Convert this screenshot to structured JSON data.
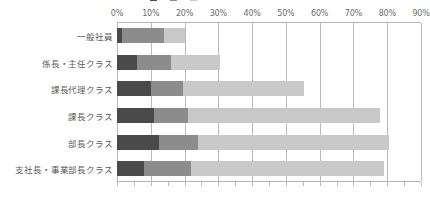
{
  "chart_data": {
    "type": "bar",
    "orientation": "horizontal",
    "stacked": true,
    "title": "",
    "xlabel": "",
    "ylabel": "",
    "xlim": [
      0,
      90
    ],
    "grid": true,
    "legend_position": "top",
    "legend_clipped": true,
    "categories": [
      "一般社員",
      "係長・主任クラス",
      "課長代理クラス",
      "課長クラス",
      "部長クラス",
      "支社長・事業部長クラス"
    ],
    "tick_labels": [
      "0%",
      "10%",
      "20%",
      "30%",
      "40%",
      "50%",
      "60%",
      "70%",
      "80%",
      "90%"
    ],
    "tick_values": [
      0,
      10,
      20,
      30,
      40,
      50,
      60,
      70,
      80,
      90
    ],
    "series": [
      {
        "name": "series-1",
        "color": "#4a4a4a",
        "values": [
          1.5,
          6.0,
          10.0,
          11.0,
          12.5,
          8.0
        ]
      },
      {
        "name": "series-2",
        "color": "#8c8c8c",
        "values": [
          12.5,
          10.0,
          9.5,
          10.0,
          11.5,
          14.0
        ]
      },
      {
        "name": "series-3",
        "color": "#c9c9c9",
        "values": [
          6.0,
          14.5,
          36.0,
          57.0,
          56.5,
          57.0
        ]
      }
    ],
    "totals": [
      20.0,
      30.5,
      55.5,
      78.0,
      80.5,
      79.0
    ]
  },
  "legend": {
    "items": [
      {
        "label": "",
        "color": "#4a4a4a"
      },
      {
        "label": "",
        "color": "#8c8c8c"
      },
      {
        "label": "",
        "color": "#c9c9c9"
      }
    ]
  },
  "colors": {
    "dark": "#4a4a4a",
    "medium": "#8c8c8c",
    "light": "#c9c9c9",
    "grid": "#b9b9b9",
    "frame": "#b5b5b5",
    "text": "#5a5a5a",
    "background": "#ffffff"
  }
}
